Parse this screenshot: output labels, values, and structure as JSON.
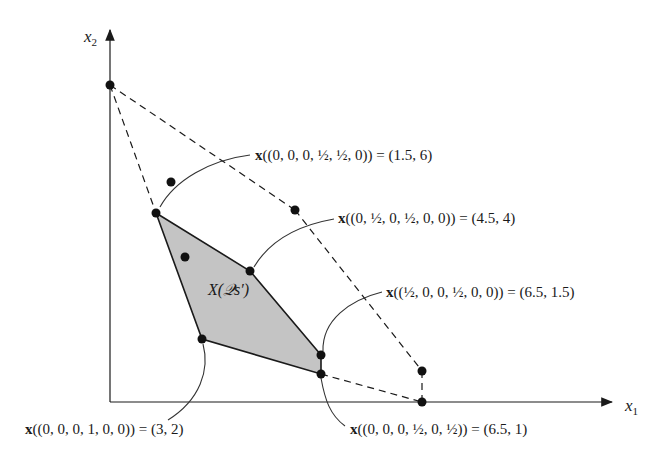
{
  "diagram": {
    "axes": {
      "x_label": "x",
      "x_sub": "1",
      "y_label": "x",
      "y_sub": "2"
    },
    "region_label": "X(𝒬s′)",
    "annotations": [
      {
        "bold": "x",
        "text": "((0, 0, 0, ½, ½, 0)) = (1.5, 6)"
      },
      {
        "bold": "x",
        "text": "((0, ½, 0, ½, 0, 0)) = (4.5, 4)"
      },
      {
        "bold": "x",
        "text": "((½, 0, 0, ½, 0, 0)) = (6.5, 1.5)"
      },
      {
        "bold": "x",
        "text": "((0, 0, 0, 1, 0, 0)) = (3, 2)"
      },
      {
        "bold": "x",
        "text": "((0, 0, 0, ½, 0, ½)) = (6.5, 1)"
      }
    ],
    "colors": {
      "region_fill": "#c4c4c4",
      "line": "#1a1a1a"
    }
  }
}
